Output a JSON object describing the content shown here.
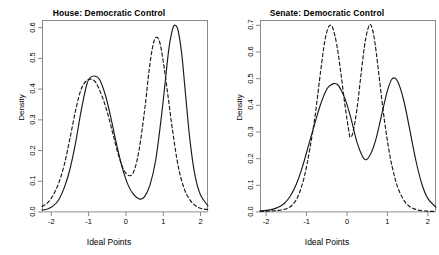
{
  "figure": {
    "background_color": "#ffffff",
    "frame_color": "#8a8a8a",
    "line_color": "#1a1a1a"
  },
  "chart_data": [
    {
      "type": "line",
      "panel": "left",
      "title": "House: Democratic Control",
      "xlabel": "Ideal Points",
      "ylabel": "Density",
      "xlim": [
        -2.25,
        2.2
      ],
      "ylim": [
        0.0,
        0.625
      ],
      "xticks": [
        -2,
        -1,
        0,
        1,
        2
      ],
      "xticklabels": [
        "-2",
        "-1",
        "0",
        "1",
        "2"
      ],
      "yticks": [
        0.0,
        0.1,
        0.2,
        0.3,
        0.4,
        0.5,
        0.6
      ],
      "yticklabels": [
        "0.0",
        "0.1",
        "0.2",
        "0.3",
        "0.4",
        "0.5",
        "0.6"
      ],
      "grid": false,
      "legend": null,
      "series": [
        {
          "name": "solid",
          "style": "solid",
          "peaks": [
            {
              "x": -0.82,
              "y": 0.442
            },
            {
              "x": 1.32,
              "y": 0.608
            }
          ],
          "trough": {
            "x": 0.37,
            "y": 0.042
          },
          "x": [
            -2.25,
            -2.1,
            -1.95,
            -1.8,
            -1.65,
            -1.5,
            -1.35,
            -1.2,
            -1.05,
            -0.95,
            -0.82,
            -0.7,
            -0.55,
            -0.4,
            -0.25,
            -0.1,
            0.05,
            0.2,
            0.37,
            0.5,
            0.65,
            0.8,
            0.95,
            1.05,
            1.15,
            1.25,
            1.32,
            1.4,
            1.5,
            1.6,
            1.72,
            1.85,
            2.0,
            2.2
          ],
          "y": [
            0.006,
            0.01,
            0.02,
            0.04,
            0.08,
            0.14,
            0.225,
            0.33,
            0.415,
            0.438,
            0.442,
            0.43,
            0.38,
            0.305,
            0.22,
            0.145,
            0.09,
            0.058,
            0.042,
            0.05,
            0.09,
            0.17,
            0.31,
            0.42,
            0.53,
            0.595,
            0.608,
            0.59,
            0.51,
            0.38,
            0.23,
            0.12,
            0.055,
            0.02
          ]
        },
        {
          "name": "dashed",
          "style": "dashed",
          "peaks": [
            {
              "x": -0.92,
              "y": 0.432
            },
            {
              "x": 0.8,
              "y": 0.568
            }
          ],
          "trough": {
            "x": 0.1,
            "y": 0.118
          },
          "x": [
            -2.25,
            -2.1,
            -1.95,
            -1.8,
            -1.65,
            -1.5,
            -1.35,
            -1.2,
            -1.05,
            -0.92,
            -0.8,
            -0.65,
            -0.5,
            -0.35,
            -0.2,
            -0.05,
            0.1,
            0.22,
            0.35,
            0.5,
            0.62,
            0.72,
            0.8,
            0.9,
            1.0,
            1.12,
            1.25,
            1.4,
            1.55,
            1.7,
            1.85,
            2.0,
            2.2
          ],
          "y": [
            0.018,
            0.03,
            0.055,
            0.095,
            0.155,
            0.24,
            0.33,
            0.4,
            0.428,
            0.432,
            0.42,
            0.38,
            0.325,
            0.255,
            0.185,
            0.135,
            0.118,
            0.135,
            0.2,
            0.33,
            0.46,
            0.54,
            0.568,
            0.555,
            0.49,
            0.385,
            0.265,
            0.15,
            0.08,
            0.042,
            0.022,
            0.012,
            0.008
          ]
        }
      ]
    },
    {
      "type": "line",
      "panel": "right",
      "title": "Senate: Democratic Control",
      "xlabel": "Ideal Points",
      "ylabel": "Density",
      "xlim": [
        -2.15,
        2.2
      ],
      "ylim": [
        0.0,
        0.72
      ],
      "xticks": [
        -2,
        -1,
        0,
        1,
        2
      ],
      "xticklabels": [
        "-2",
        "-1",
        "0",
        "1",
        "2"
      ],
      "yticks": [
        0.0,
        0.1,
        0.2,
        0.3,
        0.4,
        0.5,
        0.6,
        0.7
      ],
      "yticklabels": [
        "0.0",
        "0.1",
        "0.2",
        "0.3",
        "0.4",
        "0.5",
        "0.6",
        "0.7"
      ],
      "grid": false,
      "legend": null,
      "series": [
        {
          "name": "solid",
          "style": "solid",
          "peaks": [
            {
              "x": -0.3,
              "y": 0.482
            },
            {
              "x": 1.12,
              "y": 0.5
            }
          ],
          "trough": {
            "x": 0.42,
            "y": 0.2
          },
          "x": [
            -2.15,
            -2.0,
            -1.85,
            -1.7,
            -1.55,
            -1.4,
            -1.25,
            -1.1,
            -0.95,
            -0.8,
            -0.65,
            -0.5,
            -0.4,
            -0.3,
            -0.2,
            -0.05,
            0.1,
            0.25,
            0.42,
            0.55,
            0.7,
            0.85,
            1.0,
            1.12,
            1.25,
            1.4,
            1.55,
            1.7,
            1.85,
            2.0,
            2.2
          ],
          "y": [
            0.004,
            0.006,
            0.01,
            0.018,
            0.032,
            0.06,
            0.105,
            0.17,
            0.25,
            0.33,
            0.405,
            0.46,
            0.476,
            0.482,
            0.472,
            0.425,
            0.35,
            0.26,
            0.2,
            0.208,
            0.265,
            0.36,
            0.455,
            0.5,
            0.49,
            0.42,
            0.31,
            0.195,
            0.105,
            0.05,
            0.018
          ]
        },
        {
          "name": "dashed",
          "style": "dashed",
          "peaks": [
            {
              "x": -0.42,
              "y": 0.7
            },
            {
              "x": 0.55,
              "y": 0.7
            }
          ],
          "trough": {
            "x": 0.08,
            "y": 0.28
          },
          "x": [
            -2.15,
            -2.0,
            -1.85,
            -1.7,
            -1.55,
            -1.42,
            -1.3,
            -1.18,
            -1.05,
            -0.92,
            -0.78,
            -0.65,
            -0.55,
            -0.48,
            -0.42,
            -0.35,
            -0.25,
            -0.15,
            -0.05,
            0.05,
            0.08,
            0.15,
            0.25,
            0.35,
            0.45,
            0.55,
            0.62,
            0.7,
            0.8,
            0.92,
            1.05,
            1.18,
            1.3,
            1.45,
            1.6,
            1.8,
            2.0,
            2.2
          ],
          "y": [
            0.002,
            0.003,
            0.004,
            0.006,
            0.01,
            0.018,
            0.035,
            0.07,
            0.135,
            0.235,
            0.37,
            0.53,
            0.64,
            0.685,
            0.7,
            0.69,
            0.625,
            0.52,
            0.4,
            0.3,
            0.28,
            0.3,
            0.39,
            0.52,
            0.64,
            0.7,
            0.69,
            0.625,
            0.5,
            0.35,
            0.22,
            0.13,
            0.075,
            0.035,
            0.016,
            0.006,
            0.003,
            0.002
          ]
        }
      ]
    }
  ]
}
